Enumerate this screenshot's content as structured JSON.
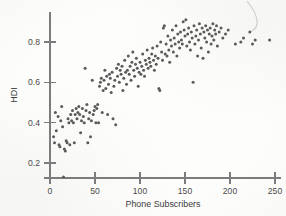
{
  "figure": {
    "title": "",
    "background_color": "#fdfdfc",
    "point_color": "#5a5a5a",
    "axis_color": "#7c7c7c"
  },
  "axes": {
    "x_title": "Phone Subscribers",
    "y_title": "HDI",
    "x_ticks": [
      "0",
      "50",
      "100",
      "150",
      "200",
      "250"
    ],
    "y_ticks": [
      "0.2",
      "0.4",
      "0.6",
      "0.8"
    ]
  },
  "annotations": {
    "scan_artifact": "pen-stroke-curve-top-right"
  },
  "chart_data": {
    "type": "scatter",
    "title": "",
    "xlabel": "Phone Subscribers",
    "ylabel": "HDI",
    "xlim": [
      0,
      255
    ],
    "ylim": [
      0.1,
      0.95
    ],
    "xticks": [
      0,
      50,
      100,
      150,
      200,
      250
    ],
    "yticks": [
      0.2,
      0.4,
      0.6,
      0.8
    ],
    "grid": false,
    "legend": "none",
    "marker": "circle",
    "marker_size": 3.0,
    "n_points": 192,
    "points": [
      [
        15,
        0.13
      ],
      [
        4,
        0.33
      ],
      [
        5,
        0.3
      ],
      [
        6,
        0.45
      ],
      [
        7,
        0.36
      ],
      [
        9,
        0.43
      ],
      [
        10,
        0.29
      ],
      [
        11,
        0.28
      ],
      [
        12,
        0.41
      ],
      [
        13,
        0.48
      ],
      [
        14,
        0.38
      ],
      [
        16,
        0.27
      ],
      [
        17,
        0.26
      ],
      [
        18,
        0.31
      ],
      [
        19,
        0.3
      ],
      [
        20,
        0.42
      ],
      [
        21,
        0.4
      ],
      [
        22,
        0.29
      ],
      [
        23,
        0.44
      ],
      [
        24,
        0.41
      ],
      [
        25,
        0.46
      ],
      [
        26,
        0.4
      ],
      [
        27,
        0.3
      ],
      [
        28,
        0.44
      ],
      [
        29,
        0.47
      ],
      [
        30,
        0.42
      ],
      [
        31,
        0.45
      ],
      [
        32,
        0.48
      ],
      [
        33,
        0.44
      ],
      [
        34,
        0.35
      ],
      [
        35,
        0.41
      ],
      [
        36,
        0.47
      ],
      [
        37,
        0.43
      ],
      [
        38,
        0.4
      ],
      [
        39,
        0.67
      ],
      [
        40,
        0.46
      ],
      [
        41,
        0.49
      ],
      [
        42,
        0.3
      ],
      [
        43,
        0.42
      ],
      [
        44,
        0.45
      ],
      [
        45,
        0.33
      ],
      [
        46,
        0.41
      ],
      [
        47,
        0.61
      ],
      [
        48,
        0.44
      ],
      [
        49,
        0.46
      ],
      [
        50,
        0.48
      ],
      [
        51,
        0.4
      ],
      [
        52,
        0.47
      ],
      [
        53,
        0.49
      ],
      [
        54,
        0.4
      ],
      [
        55,
        0.58
      ],
      [
        56,
        0.6
      ],
      [
        57,
        0.62
      ],
      [
        58,
        0.45
      ],
      [
        59,
        0.56
      ],
      [
        60,
        0.61
      ],
      [
        61,
        0.66
      ],
      [
        62,
        0.57
      ],
      [
        63,
        0.63
      ],
      [
        64,
        0.44
      ],
      [
        65,
        0.59
      ],
      [
        66,
        0.64
      ],
      [
        67,
        0.62
      ],
      [
        68,
        0.55
      ],
      [
        69,
        0.65
      ],
      [
        70,
        0.42
      ],
      [
        71,
        0.58
      ],
      [
        72,
        0.61
      ],
      [
        73,
        0.39
      ],
      [
        74,
        0.67
      ],
      [
        75,
        0.63
      ],
      [
        76,
        0.69
      ],
      [
        77,
        0.6
      ],
      [
        78,
        0.66
      ],
      [
        79,
        0.64
      ],
      [
        80,
        0.68
      ],
      [
        81,
        0.56
      ],
      [
        82,
        0.62
      ],
      [
        83,
        0.71
      ],
      [
        84,
        0.65
      ],
      [
        85,
        0.59
      ],
      [
        86,
        0.66
      ],
      [
        87,
        0.73
      ],
      [
        88,
        0.64
      ],
      [
        89,
        0.68
      ],
      [
        90,
        0.61
      ],
      [
        91,
        0.7
      ],
      [
        92,
        0.75
      ],
      [
        93,
        0.66
      ],
      [
        94,
        0.63
      ],
      [
        95,
        0.69
      ],
      [
        96,
        0.72
      ],
      [
        97,
        0.67
      ],
      [
        98,
        0.58
      ],
      [
        99,
        0.65
      ],
      [
        100,
        0.7
      ],
      [
        101,
        0.64
      ],
      [
        102,
        0.68
      ],
      [
        103,
        0.74
      ],
      [
        104,
        0.66
      ],
      [
        105,
        0.63
      ],
      [
        106,
        0.71
      ],
      [
        107,
        0.69
      ],
      [
        108,
        0.76
      ],
      [
        109,
        0.67
      ],
      [
        110,
        0.72
      ],
      [
        111,
        0.7
      ],
      [
        112,
        0.68
      ],
      [
        113,
        0.74
      ],
      [
        114,
        0.77
      ],
      [
        115,
        0.71
      ],
      [
        116,
        0.66
      ],
      [
        117,
        0.73
      ],
      [
        118,
        0.69
      ],
      [
        119,
        0.78
      ],
      [
        120,
        0.72
      ],
      [
        121,
        0.57
      ],
      [
        122,
        0.56
      ],
      [
        123,
        0.8
      ],
      [
        124,
        0.75
      ],
      [
        125,
        0.71
      ],
      [
        126,
        0.87
      ],
      [
        127,
        0.88
      ],
      [
        128,
        0.74
      ],
      [
        129,
        0.79
      ],
      [
        130,
        0.73
      ],
      [
        131,
        0.83
      ],
      [
        132,
        0.76
      ],
      [
        133,
        0.7
      ],
      [
        134,
        0.81
      ],
      [
        135,
        0.78
      ],
      [
        136,
        0.86
      ],
      [
        137,
        0.75
      ],
      [
        138,
        0.82
      ],
      [
        139,
        0.79
      ],
      [
        140,
        0.88
      ],
      [
        141,
        0.73
      ],
      [
        142,
        0.84
      ],
      [
        143,
        0.8
      ],
      [
        144,
        0.77
      ],
      [
        145,
        0.85
      ],
      [
        146,
        0.81
      ],
      [
        147,
        0.79
      ],
      [
        148,
        0.9
      ],
      [
        149,
        0.86
      ],
      [
        150,
        0.83
      ],
      [
        151,
        0.91
      ],
      [
        152,
        0.78
      ],
      [
        153,
        0.84
      ],
      [
        154,
        0.87
      ],
      [
        155,
        0.8
      ],
      [
        156,
        0.76
      ],
      [
        157,
        0.85
      ],
      [
        158,
        0.82
      ],
      [
        159,
        0.6
      ],
      [
        160,
        0.88
      ],
      [
        161,
        0.79
      ],
      [
        162,
        0.83
      ],
      [
        163,
        0.86
      ],
      [
        164,
        0.73
      ],
      [
        165,
        0.81
      ],
      [
        166,
        0.89
      ],
      [
        167,
        0.84
      ],
      [
        168,
        0.77
      ],
      [
        169,
        0.87
      ],
      [
        170,
        0.72
      ],
      [
        171,
        0.85
      ],
      [
        172,
        0.82
      ],
      [
        173,
        0.88
      ],
      [
        174,
        0.8
      ],
      [
        175,
        0.86
      ],
      [
        176,
        0.75
      ],
      [
        177,
        0.84
      ],
      [
        178,
        0.87
      ],
      [
        179,
        0.79
      ],
      [
        180,
        0.83
      ],
      [
        181,
        0.89
      ],
      [
        182,
        0.81
      ],
      [
        183,
        0.86
      ],
      [
        184,
        0.84
      ],
      [
        185,
        0.88
      ],
      [
        186,
        0.78
      ],
      [
        188,
        0.85
      ],
      [
        190,
        0.87
      ],
      [
        192,
        0.82
      ],
      [
        195,
        0.84
      ],
      [
        198,
        0.86
      ],
      [
        206,
        0.79
      ],
      [
        212,
        0.8
      ],
      [
        215,
        0.82
      ],
      [
        222,
        0.85
      ],
      [
        225,
        0.79
      ],
      [
        228,
        0.81
      ],
      [
        244,
        0.81
      ]
    ]
  }
}
